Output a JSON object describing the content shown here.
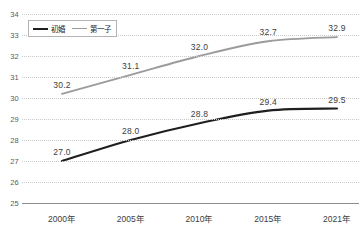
{
  "chart_data": {
    "type": "line",
    "title": "",
    "xlabel": "",
    "ylabel": "",
    "categories": [
      "2000年",
      "2005年",
      "2010年",
      "2015年",
      "2021年"
    ],
    "ylim": [
      25,
      34
    ],
    "yticks": [
      "25",
      "26",
      "27",
      "28",
      "29",
      "30",
      "31",
      "32",
      "33",
      "34"
    ],
    "grid": true,
    "legend_position": "top-left",
    "series": [
      {
        "name": "初婚",
        "color": "#1f1f1f",
        "values": [
          27.0,
          28.0,
          28.8,
          29.4,
          29.5
        ],
        "labels": [
          "27.0",
          "28.0",
          "28.8",
          "29.4",
          "29.5"
        ]
      },
      {
        "name": "第一子",
        "color": "#9b9b9b",
        "values": [
          30.2,
          31.1,
          32.0,
          32.7,
          32.9
        ],
        "labels": [
          "30.2",
          "31.1",
          "32.0",
          "32.7",
          "32.9"
        ]
      }
    ]
  },
  "colors": {
    "background": "#ffffff",
    "gridline": "#c9c9c9",
    "axis": "#8d8d8d",
    "tick_text": "#3d3d3d",
    "series_first_marriage": "#1f1f1f",
    "series_first_child": "#9b9b9b"
  }
}
